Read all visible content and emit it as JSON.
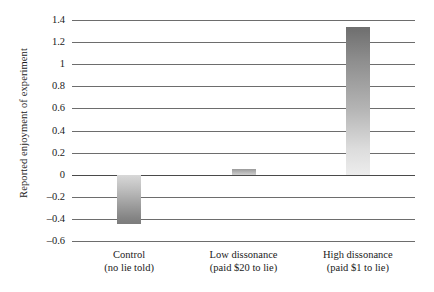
{
  "chart_data": {
    "type": "bar",
    "title": "",
    "subtitle": "",
    "xlabel": "",
    "ylabel": "Reported enjoyment of experiment",
    "categories": [
      "Control\n(no lie told)",
      "Low dissonance\n(paid $20 to lie)",
      "High dissonance\n(paid $1 to lie)"
    ],
    "category_lines": [
      {
        "line1": "Control",
        "line2": "(no lie told)"
      },
      {
        "line1": "Low dissonance",
        "line2": "(paid $20 to lie)"
      },
      {
        "line1": "High dissonance",
        "line2": "(paid $1 to lie)"
      }
    ],
    "values": [
      -0.45,
      0.05,
      1.34
    ],
    "ylim": [
      -0.6,
      1.4
    ],
    "ytick_values": [
      1.4,
      1.2,
      1,
      0.8,
      0.6,
      0.4,
      0.2,
      0,
      -0.2,
      -0.4,
      -0.6
    ],
    "ytick_labels": [
      "1.4",
      "1.2",
      "1",
      "0.8",
      "0.6",
      "0.4",
      "0.2",
      "0",
      "–0.2",
      "–0.4",
      "–0.6"
    ],
    "grid": true,
    "grid_axis": "y",
    "legend": false,
    "legend_position": "none",
    "bar_colors": [
      "#9d9d9d",
      "#b5b5b5",
      "#9f9f9f"
    ],
    "background_color": "#ffffff",
    "gridline_color": "#6d6d6d",
    "zero_line_color": "#4a4a4a"
  }
}
